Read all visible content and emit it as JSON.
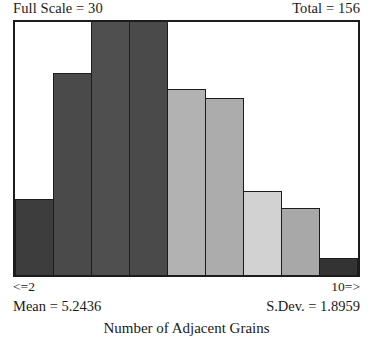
{
  "header": {
    "full_scale_label": "Full Scale = 30",
    "total_label": "Total = 156"
  },
  "axis": {
    "left_end_label": "<=2",
    "right_end_label": "10=>"
  },
  "stats": {
    "mean_label": "Mean = 5.2436",
    "stdev_label": "S.Dev. = 1.8959"
  },
  "caption": {
    "text": "Number of Adjacent Grains"
  },
  "chart_data": {
    "type": "bar",
    "title": "Number of Adjacent Grains",
    "xlabel": "Number of Adjacent Grains",
    "ylabel": "",
    "ylim": [
      0,
      30
    ],
    "grid": false,
    "legend": "none",
    "full_scale": 30,
    "total": 156,
    "mean": 5.2436,
    "stdev": 1.8959,
    "x_axis_start_label": "<=2",
    "x_axis_end_label": "10=>",
    "categories": [
      "<=2",
      "3",
      "4",
      "5",
      "6",
      "7",
      "8",
      "9",
      "10=>"
    ],
    "values": [
      9,
      24,
      30,
      30,
      22,
      21,
      10,
      8,
      2
    ],
    "bar_colors": [
      "#3d3d3d",
      "#4a4a4a",
      "#4f4f4f",
      "#4a4a4a",
      "#b2b2b2",
      "#acacac",
      "#d2d2d2",
      "#a8a8a8",
      "#333333"
    ],
    "bar_outline_color": "#1c1c1c",
    "frame_color": "#1c1c1c",
    "background_color": "#ffffff"
  }
}
